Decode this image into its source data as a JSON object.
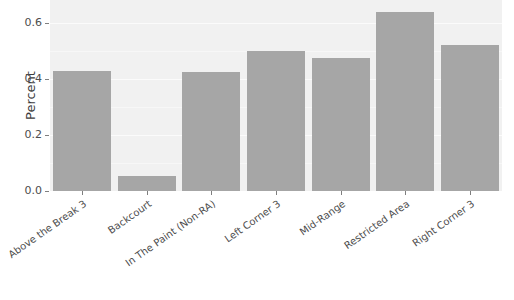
{
  "chart_data": {
    "type": "bar",
    "title": "",
    "subtitle": "",
    "xlabel": "",
    "ylabel": "Percent",
    "categories": [
      "Above the Break 3",
      "Backcourt",
      "In The Paint (Non-RA)",
      "Left Corner 3",
      "Mid-Range",
      "Restricted Area",
      "Right Corner 3"
    ],
    "values": [
      0.43,
      0.055,
      0.425,
      0.5,
      0.475,
      0.64,
      0.52
    ],
    "ylim": [
      0.0,
      0.682
    ],
    "ytick_values": [
      0.0,
      0.2,
      0.4,
      0.6
    ],
    "ytick_labels": [
      "0.0",
      "0.2",
      "0.4",
      "0.6"
    ],
    "grid": true,
    "legend": "none",
    "bar_color": "#a6a6a6",
    "panel_color": "#f1f1f1",
    "gridline_color": "#fbfbfb",
    "axis_text_color": "#4d4d4d"
  }
}
